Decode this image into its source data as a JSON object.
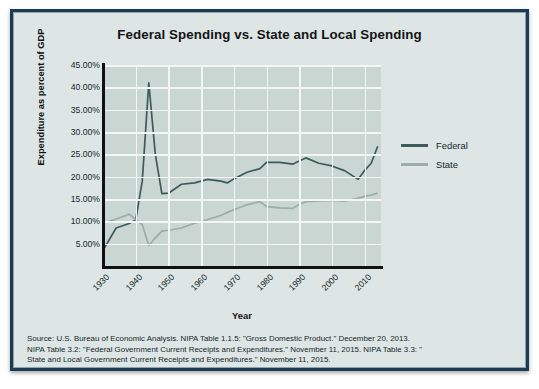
{
  "chart_data": {
    "type": "line",
    "title": "Federal Spending vs. State and Local Spending",
    "xlabel": "Year",
    "ylabel": "Expenditure as percent of GDP",
    "grid": true,
    "legend_position": "right",
    "xlim": [
      1930,
      2015
    ],
    "ylim": [
      0,
      45
    ],
    "ytick_labels": [
      "45.00%",
      "40.00%",
      "35.00%",
      "30.00%",
      "25.00%",
      "20.00%",
      "15.00%",
      "10.00%",
      "5.00%"
    ],
    "ytick_values": [
      45,
      40,
      35,
      30,
      25,
      20,
      15,
      10,
      5
    ],
    "xtick_labels": [
      "1930",
      "1940",
      "1950",
      "1960",
      "1970",
      "1980",
      "1990",
      "2000",
      "2010"
    ],
    "xtick_values": [
      1930,
      1940,
      1950,
      1960,
      1970,
      1980,
      1990,
      2000,
      2010
    ],
    "series": [
      {
        "name": "Federal",
        "color": "#3e5b5c",
        "x": [
          1930,
          1934,
          1938,
          1940,
          1942,
          1944,
          1946,
          1948,
          1950,
          1954,
          1958,
          1962,
          1966,
          1968,
          1970,
          1974,
          1978,
          1980,
          1984,
          1988,
          1990,
          1992,
          1996,
          2000,
          2004,
          2008,
          2010,
          2012,
          2014
        ],
        "values": [
          3.5,
          8.5,
          9.5,
          10.3,
          19.0,
          41.0,
          25.0,
          16.2,
          16.3,
          18.3,
          18.6,
          19.4,
          19.0,
          18.6,
          19.5,
          21.0,
          21.8,
          23.2,
          23.2,
          22.8,
          23.5,
          24.2,
          23.0,
          22.4,
          21.3,
          19.4,
          21.4,
          23.0,
          26.8
        ]
      },
      {
        "name": "State",
        "color": "#9dacab",
        "x": [
          1930,
          1934,
          1938,
          1940,
          1942,
          1944,
          1946,
          1948,
          1950,
          1954,
          1958,
          1962,
          1966,
          1968,
          1970,
          1974,
          1978,
          1980,
          1984,
          1988,
          1990,
          1992,
          1996,
          2000,
          2004,
          2008,
          2010,
          2012,
          2014
        ],
        "values": [
          9.6,
          10.5,
          11.6,
          10.4,
          9.3,
          4.6,
          6.3,
          7.8,
          8.0,
          8.5,
          9.6,
          10.4,
          11.3,
          12.0,
          12.6,
          13.7,
          14.4,
          13.3,
          13.0,
          12.9,
          13.8,
          14.4,
          14.6,
          14.7,
          14.5,
          15.2,
          15.6,
          15.9,
          16.3
        ]
      }
    ]
  },
  "legend": {
    "items": [
      {
        "label": "Federal",
        "color": "#3e5b5c"
      },
      {
        "label": "State",
        "color": "#9dacab"
      }
    ]
  },
  "source": {
    "line1": "Source: U.S. Bureau of Economic Analysis. NIPA Table 1.1.5: \"Gross Domestic Product.\" December 20, 2013.",
    "line2": "NIPA Table 3.2: \"Federal Government Current Receipts and Expenditures.\" November 11, 2015. NIPA Table 3.3: \"",
    "line3": "State and Local Government Current Receipts and Expenditures.\" November 11, 2015."
  },
  "colors": {
    "frame_border": "#1d3b55",
    "background": "#dde6e4",
    "plot_background": "#c9d6d2",
    "gridline": "#f2f7f5",
    "axis": "#111111"
  }
}
